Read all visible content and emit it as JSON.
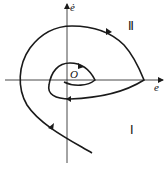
{
  "diagram": {
    "type": "phase-plane-trajectory",
    "axes": {
      "x_label": "e",
      "y_label": "ė",
      "origin_label": "O"
    },
    "regions": [
      {
        "id": "region-2",
        "label": "Ⅱ"
      },
      {
        "id": "region-1",
        "label": "Ⅰ"
      }
    ],
    "colors": {
      "stroke": "#1a1a1a",
      "background": "#ffffff"
    }
  }
}
